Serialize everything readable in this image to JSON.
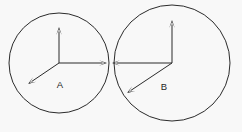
{
  "figure": {
    "background_color": "#f8f8f8",
    "stroke_color": "#2b2b2b",
    "label_color": "#1f1f1f",
    "width": 242,
    "height": 132
  },
  "chart_data": {
    "type": "diagram",
    "xlabel": "",
    "ylabel": "",
    "xlim": [
      0,
      242
    ],
    "ylim": [
      0,
      132
    ],
    "grid": false,
    "legend": "none",
    "bodies": [
      {
        "label": "A",
        "center": [
          59,
          63
        ],
        "radius": 50,
        "label_position": [
          60,
          88
        ],
        "vectors": [
          {
            "name": "up",
            "from": [
              59,
              63
            ],
            "to": [
              59,
              27
            ],
            "angle_deg": 90,
            "length": 36
          },
          {
            "name": "right",
            "from": [
              59,
              63
            ],
            "to": [
              107,
              63
            ],
            "angle_deg": 0,
            "length": 48
          },
          {
            "name": "down-left",
            "from": [
              59,
              63
            ],
            "to": [
              28,
              84
            ],
            "angle_deg": 214,
            "length": 37
          }
        ]
      },
      {
        "label": "B",
        "center": [
          172,
          63
        ],
        "radius": 58,
        "label_position": [
          164,
          90
        ],
        "vectors": [
          {
            "name": "up",
            "from": [
              172,
              63
            ],
            "to": [
              172,
              20
            ],
            "angle_deg": 90,
            "length": 43
          },
          {
            "name": "left",
            "from": [
              172,
              63
            ],
            "to": [
              112,
              63
            ],
            "angle_deg": 180,
            "length": 60
          },
          {
            "name": "down-left",
            "from": [
              172,
              63
            ],
            "to": [
              127,
              93
            ],
            "angle_deg": 214,
            "length": 54
          }
        ]
      }
    ],
    "tangency_point": [
      109,
      63
    ],
    "annotations": [
      {
        "text": "A",
        "position": [
          60,
          88
        ]
      },
      {
        "text": "B",
        "position": [
          164,
          90
        ]
      }
    ]
  }
}
